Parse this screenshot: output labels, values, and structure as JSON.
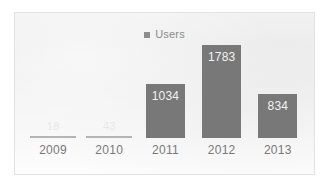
{
  "chart_data": {
    "type": "bar",
    "title": "",
    "subtitle": "",
    "xlabel": "",
    "ylabel": "",
    "grid": false,
    "legend_position": "top-center",
    "legend": [
      "Users"
    ],
    "categories": [
      "2009",
      "2010",
      "2011",
      "2012",
      "2013"
    ],
    "series": [
      {
        "name": "Users",
        "values": [
          18,
          43,
          1034,
          1783,
          834
        ],
        "color": "#787878"
      }
    ],
    "data_labels": [
      "18",
      "43",
      "1034",
      "1783",
      "834"
    ],
    "ylim": [
      0,
      1783
    ],
    "axis": {
      "x_ticks": [
        "2009",
        "2010",
        "2011",
        "2012",
        "2013"
      ],
      "y_ticks": []
    }
  },
  "legend": {
    "marker": "square-swatch-icon",
    "label": "Users",
    "color": "#8d8d8d"
  },
  "bars": [
    {
      "category": "2009",
      "value": 18,
      "label": "18",
      "tiny": true
    },
    {
      "category": "2010",
      "value": 43,
      "label": "43",
      "tiny": true
    },
    {
      "category": "2011",
      "value": 1034,
      "label": "1034",
      "tiny": false
    },
    {
      "category": "2012",
      "value": 1783,
      "label": "1783",
      "tiny": false
    },
    {
      "category": "2013",
      "value": 834,
      "label": "834",
      "tiny": false
    }
  ],
  "colors": {
    "bar": "#787878",
    "bar_tiny": "#b4b4b4",
    "axis_text": "#787878",
    "legend_text": "#8a8a8a",
    "frame_border": "#e2e2e2",
    "value_text": "#f2f2f2"
  }
}
